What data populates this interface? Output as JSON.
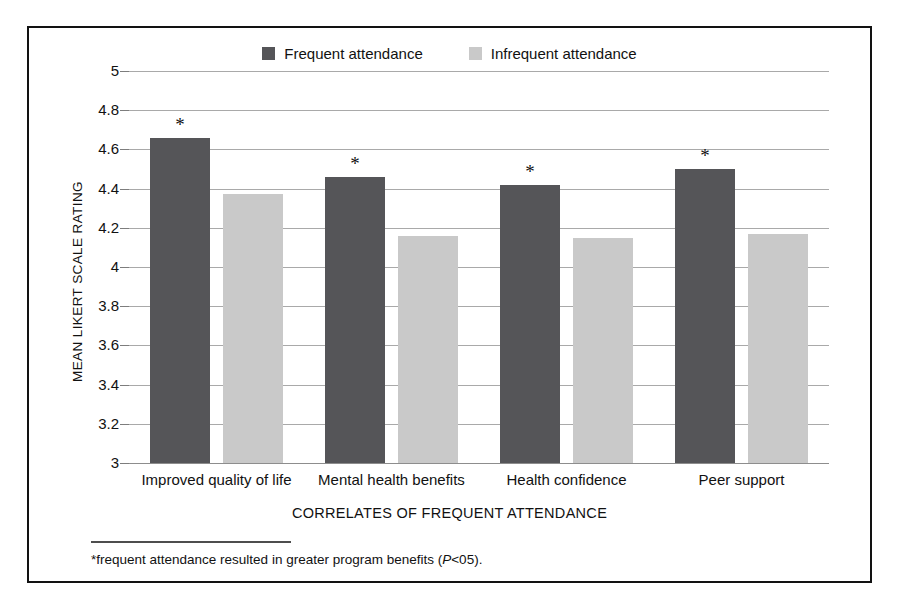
{
  "chart_data": {
    "type": "bar",
    "title": "",
    "xlabel": "CORRELATES OF FREQUENT ATTENDANCE",
    "ylabel": "MEAN LIKERT SCALE RATING",
    "ylim": [
      3,
      5
    ],
    "ytick_step": 0.2,
    "yticks": [
      "5",
      "4.8",
      "4.6",
      "4.4",
      "4.2",
      "4",
      "3.8",
      "3.6",
      "3.4",
      "3.2",
      "3"
    ],
    "ytick_values": [
      5,
      4.8,
      4.6,
      4.4,
      4.2,
      4,
      3.8,
      3.6,
      3.4,
      3.2,
      3
    ],
    "grid": true,
    "grid_axis": "y",
    "legend_position": "top-center",
    "categories": [
      "Improved quality of life",
      "Mental health benefits",
      "Health confidence",
      "Peer support"
    ],
    "series": [
      {
        "name": "Frequent attendance",
        "color": "#555558",
        "values": [
          4.66,
          4.46,
          4.42,
          4.5
        ],
        "annotations": [
          "*",
          "*",
          "*",
          "*"
        ]
      },
      {
        "name": "Infrequent attendance",
        "color": "#c9c9c9",
        "values": [
          4.37,
          4.16,
          4.15,
          4.17
        ],
        "annotations": [
          "",
          "",
          "",
          ""
        ]
      }
    ],
    "annotation_note": "* marks significant differences on frequent-attendance bars"
  },
  "legend": {
    "entries": [
      {
        "label": "Frequent attendance",
        "color": "#555558"
      },
      {
        "label": "Infrequent attendance",
        "color": "#c9c9c9"
      }
    ]
  },
  "footnote": {
    "prefix": "*frequent attendance resulted in greater program benefits (",
    "italic": "P",
    "suffix": "<05)."
  }
}
